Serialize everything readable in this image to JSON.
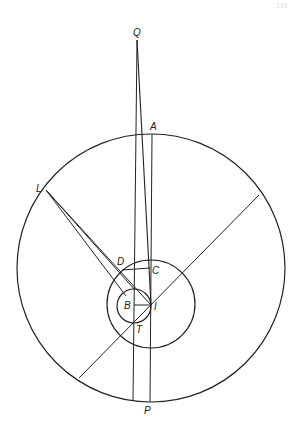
{
  "page": {
    "number": "191"
  },
  "diagram": {
    "stroke_color": "#222222",
    "labels": {
      "Q": "Q",
      "A": "A",
      "L": "L",
      "D": "D",
      "C": "C",
      "B": "B",
      "I": "I",
      "T": "T",
      "P": "P"
    },
    "circles": [
      {
        "name": "outer",
        "cx": 151,
        "cy": 268,
        "r": 134
      },
      {
        "name": "middle",
        "cx": 151,
        "cy": 304,
        "r": 44
      },
      {
        "name": "inner",
        "cx": 134,
        "cy": 306,
        "r": 17
      }
    ]
  }
}
